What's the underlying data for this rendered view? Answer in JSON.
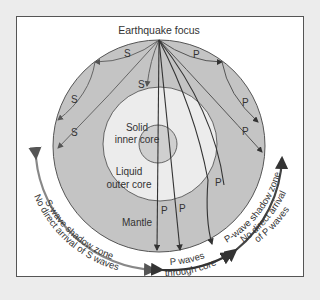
{
  "diagram": {
    "title": "Earthquake focus",
    "layers": {
      "inner_core": [
        "Solid",
        "inner core"
      ],
      "outer_core": [
        "Liquid",
        "outer core"
      ],
      "mantle": "Mantle"
    },
    "wave_labels": {
      "s": "S",
      "p": "P"
    },
    "zones": {
      "s_shadow": "S-wave shadow zone",
      "s_no_arrival": "No direct arrival of S waves",
      "p_core_1": "P waves",
      "p_core_2": "through core",
      "p_shadow": "P-wave shadow zone",
      "p_no_arrival_1": "No direct arrival",
      "p_no_arrival_2": "of P waves"
    },
    "colors": {
      "mantle": "#c4c4c4",
      "outer_core": "#ececec",
      "inner_core": "#cfcfcf",
      "frame_bg": "#ffffff",
      "page_bg": "#ececec",
      "arrow_s": "#777777",
      "arrow_p": "#444444"
    }
  }
}
